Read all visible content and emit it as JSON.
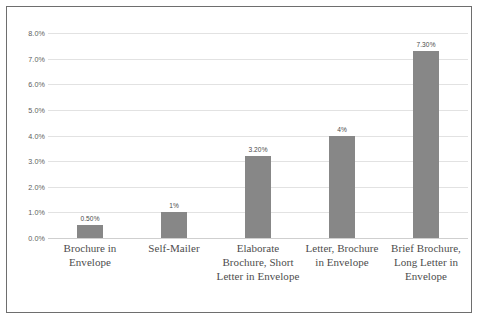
{
  "chart_data": {
    "type": "bar",
    "title": "",
    "subtitle": "",
    "xlabel": "",
    "ylabel": "",
    "ylim": [
      0,
      8
    ],
    "grid": true,
    "legend": false,
    "legend_position": "none",
    "bar_color": "#878787",
    "gridline_color": "#e2e2e2",
    "axis_text_color": "#5d5d5d",
    "categories": [
      "Brochure in Envelope",
      "Self-Mailer",
      "Elaborate Brochure, Short Letter in Envelope",
      "Letter, Brochure in Envelope",
      "Brief Brochure, Long Letter in Envelope"
    ],
    "values": [
      0.5,
      1.0,
      3.2,
      4.0,
      7.3
    ],
    "value_labels": [
      "0.50%",
      "1%",
      "3.20%",
      "4%",
      "7.30%"
    ],
    "ytick_values": [
      0.0,
      1.0,
      2.0,
      3.0,
      4.0,
      5.0,
      6.0,
      7.0,
      8.0
    ],
    "ytick_labels": [
      "0.0%",
      "1.0%",
      "2.0%",
      "3.0%",
      "4.0%",
      "5.0%",
      "6.0%",
      "7.0%",
      "8.0%"
    ]
  },
  "frame": {
    "border_color": "#6e6e6e",
    "background": "#ffffff"
  }
}
